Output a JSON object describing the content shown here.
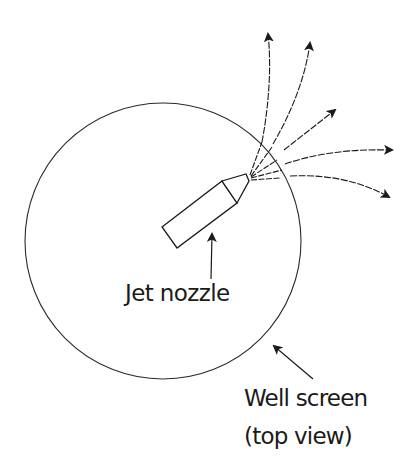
{
  "diagram": {
    "colors": {
      "background": "#ffffff",
      "stroke": "#1a1a1a"
    },
    "labels": {
      "jet_nozzle": "Jet nozzle",
      "well_screen_line1": "Well screen",
      "well_screen_line2": "(top view)"
    },
    "elements": {
      "well_screen_circle": {
        "cx": 163,
        "cy": 241,
        "r": 138
      },
      "nozzle": {
        "body_corners": [
          [
            162,
            227
          ],
          [
            222,
            181
          ],
          [
            237,
            203
          ],
          [
            177,
            248
          ]
        ],
        "tip": [
          248,
          177
        ]
      },
      "jet_streams_count": 5,
      "label_arrows": [
        "jet-nozzle-pointer",
        "well-screen-pointer"
      ]
    }
  }
}
